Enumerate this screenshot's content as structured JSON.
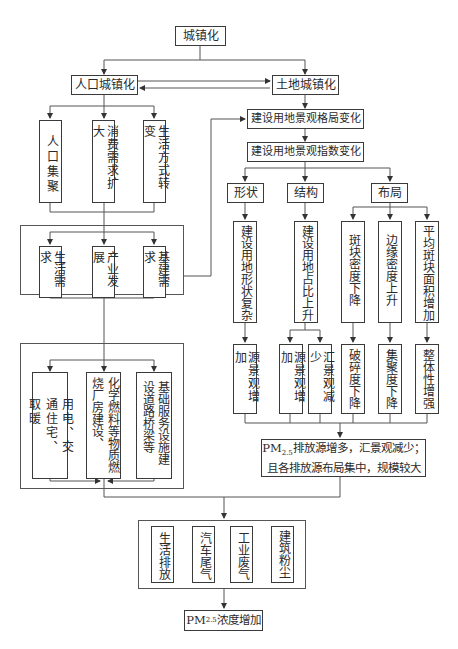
{
  "root": "城镇化",
  "population": "人口城镇化",
  "land": "土地城镇化",
  "pop_children": [
    "人口集聚",
    "消费需求扩大",
    "生活方式转变"
  ],
  "needs": [
    "生活需求",
    "产业发展",
    "基建需求"
  ],
  "activities": [
    "用电、交通住宅、取暖",
    "化学燃料等物质燃烧厂房建设、",
    "基础服务设施建设道路桥梁等"
  ],
  "landscape_pattern": "建设用地景观格局变化",
  "landscape_index": "建设用地景观指数变化",
  "categories": [
    "形状",
    "结构",
    "布局"
  ],
  "indices": [
    "建设用地形状复杂",
    "建设用地占比上升",
    "斑块密度下降",
    "边缘密度上升",
    "平均斑块面积增加"
  ],
  "effects": [
    "源景观增加",
    "源景观增加",
    "汇景观减少",
    "破碎度下降",
    "集聚度下降",
    "整体性增强"
  ],
  "summary": {
    "line1_prefix": "PM",
    "line1_sub": "2.5",
    "line1_rest": "排放源增多，汇景观减少；",
    "line2": "且各排放源布局集中，规模较大"
  },
  "sources": [
    "生活排放",
    "汽车尾气",
    "工业废气",
    "建筑粉尘"
  ],
  "final": {
    "prefix": "PM",
    "sub": "2.5",
    "rest": "浓度增加"
  }
}
